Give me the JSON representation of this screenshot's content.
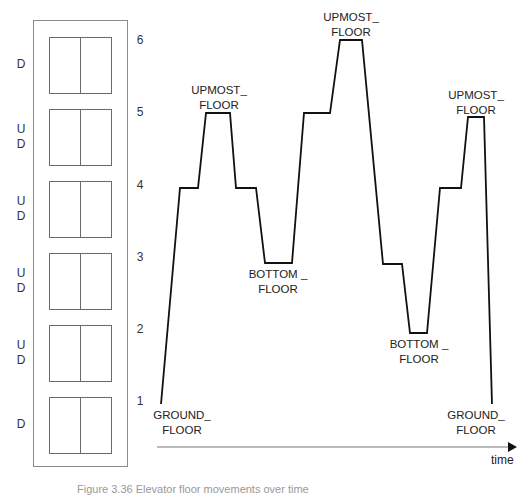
{
  "figure": {
    "type": "elevator-floor-trajectory",
    "caption_partial": "Figure 3.36 Elevator floor movements over time"
  },
  "building": {
    "floors": [
      {
        "number": "6",
        "buttons": [
          "D"
        ]
      },
      {
        "number": "5",
        "buttons": [
          "U",
          "D"
        ]
      },
      {
        "number": "4",
        "buttons": [
          "U",
          "D"
        ]
      },
      {
        "number": "3",
        "buttons": [
          "U",
          "D"
        ]
      },
      {
        "number": "2",
        "buttons": [
          "U",
          "D"
        ]
      },
      {
        "number": "1",
        "buttons": [
          "D"
        ]
      }
    ]
  },
  "plot": {
    "axis_label": "time",
    "levels": [
      "1",
      "2",
      "3",
      "4",
      "5",
      "6"
    ],
    "trajectory_floors": [
      1,
      4,
      4,
      5,
      5,
      4,
      4,
      3,
      3,
      5,
      5,
      6,
      6,
      3,
      3,
      2,
      2,
      4,
      4,
      5,
      5,
      1
    ],
    "annotations": [
      {
        "id": "ground-start",
        "text": "GROUND_\nFLOOR"
      },
      {
        "id": "upmost-1",
        "text": "UPMOST_\nFLOOR"
      },
      {
        "id": "bottom-1",
        "text": "BOTTOM _\nFLOOR"
      },
      {
        "id": "upmost-2",
        "text": "UPMOST_\nFLOOR"
      },
      {
        "id": "bottom-2",
        "text": "BOTTOM _\nFLOOR"
      },
      {
        "id": "upmost-3",
        "text": "UPMOST_\nFLOOR"
      },
      {
        "id": "ground-end",
        "text": "GROUND_\nFLOOR"
      }
    ]
  },
  "colors": {
    "line": "#111111",
    "building_border": "#8a8a8a",
    "axis": "#666666"
  }
}
